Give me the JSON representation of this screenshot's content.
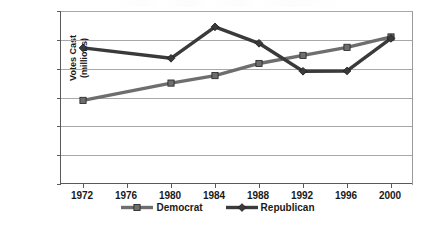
{
  "chart_data": {
    "type": "line",
    "title": "",
    "xlabel": "",
    "ylabel": "Votes Cast (millions)",
    "ylabel_line1": "Votes Cast",
    "ylabel_line2": "(millions)",
    "categories": [
      "1972",
      "1976",
      "1980",
      "1984",
      "1988",
      "1992",
      "1996",
      "2000"
    ],
    "x": [
      1972,
      1976,
      1980,
      1984,
      1988,
      1992,
      1996,
      2000
    ],
    "xlim": [
      1970,
      2002
    ],
    "ylim": [
      0,
      60
    ],
    "yticks": [
      0,
      10,
      20,
      30,
      40,
      50,
      60
    ],
    "grid": true,
    "legend_position": "bottom",
    "series": [
      {
        "name": "Democrat",
        "color": "#6e6e6e",
        "marker": "square",
        "x": [
          1972,
          1980,
          1984,
          1988,
          1992,
          1996,
          2000
        ],
        "values": [
          29,
          35,
          37.6,
          41.8,
          44.6,
          47.4,
          51
        ]
      },
      {
        "name": "Republican",
        "color": "#3a3a3a",
        "marker": "diamond",
        "x": [
          1972,
          1980,
          1984,
          1988,
          1992,
          1996,
          2000
        ],
        "values": [
          47.2,
          43.6,
          54.5,
          48.8,
          39.1,
          39.2,
          50.5
        ]
      }
    ]
  },
  "axes": {
    "y_tick_labels": [
      "60",
      "50",
      "40",
      "30",
      "20",
      "10",
      "0"
    ],
    "y_tick_values": [
      60,
      50,
      40,
      30,
      20,
      10,
      0
    ],
    "x_tick_labels": [
      "1972",
      "1976",
      "1980",
      "1984",
      "1988",
      "1992",
      "1996",
      "2000"
    ],
    "y_title_line1": "Votes Cast",
    "y_title_line2": "(millions)"
  },
  "legend": {
    "items": [
      {
        "label": "Democrat",
        "color": "#6e6e6e",
        "marker": "square"
      },
      {
        "label": "Republican",
        "color": "#3a3a3a",
        "marker": "diamond"
      }
    ]
  },
  "colors": {
    "democrat": "#6e6e6e",
    "republican": "#3a3a3a",
    "grid": "#a8a8a8",
    "axis": "#5a5a5a",
    "text": "#1a1a1a",
    "background": "#ffffff"
  }
}
